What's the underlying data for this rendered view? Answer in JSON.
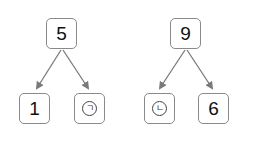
{
  "diagram": {
    "type": "number-bond",
    "colors": {
      "box_border": "#8a8a8a",
      "arrow": "#7a7a7a",
      "text": "#111111"
    },
    "trees": [
      {
        "root": {
          "label": "5"
        },
        "children": [
          {
            "label": "1",
            "kind": "number"
          },
          {
            "label": "ㄱ",
            "kind": "circled-placeholder",
            "icon": "circled-giyeok"
          }
        ]
      },
      {
        "root": {
          "label": "9"
        },
        "children": [
          {
            "label": "ㄴ",
            "kind": "circled-placeholder",
            "icon": "circled-nieun"
          },
          {
            "label": "6",
            "kind": "number"
          }
        ]
      }
    ]
  }
}
